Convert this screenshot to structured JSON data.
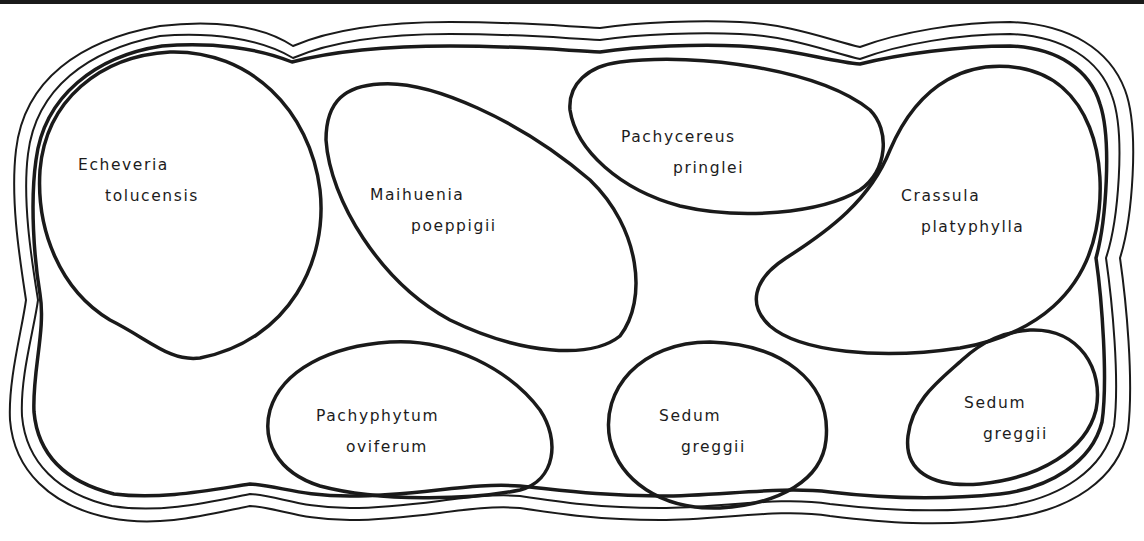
{
  "diagram": {
    "type": "planting-plan",
    "line_color": "#1a1a1a",
    "background": "#ffffff",
    "border": {
      "description": "wavy bed outline drawn as two outer thin lines and one inner thick line"
    },
    "plants": [
      {
        "id": "echeveria-tolucensis",
        "genus": "Echeveria",
        "species": "tolucensis"
      },
      {
        "id": "maihuenia-poeppigii",
        "genus": "Maihuenia",
        "species": "poeppigii"
      },
      {
        "id": "pachycereus-pringlei",
        "genus": "Pachycereus",
        "species": "pringlei"
      },
      {
        "id": "crassula-platyphylla",
        "genus": "Crassula",
        "species": "platyphylla"
      },
      {
        "id": "pachyphytum-oviferum",
        "genus": "Pachyphytum",
        "species": "oviferum"
      },
      {
        "id": "sedum-greggii-center",
        "genus": "Sedum",
        "species": "greggii"
      },
      {
        "id": "sedum-greggii-right",
        "genus": "Sedum",
        "species": "greggii"
      }
    ]
  }
}
